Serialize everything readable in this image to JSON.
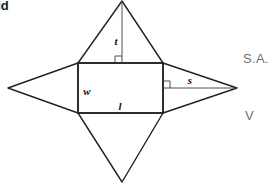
{
  "page": {
    "background_color": "#ffffff",
    "width": 276,
    "height": 184
  },
  "heading": {
    "text": "mid",
    "note_full_word": "pyramid",
    "clipped_left": true,
    "color": "#1b1b1b"
  },
  "formulas": {
    "surface_area_label": "S.A.",
    "volume_label": "V",
    "color": "#6f6f6f"
  },
  "diagram": {
    "stroke_color": "#222222",
    "fill_color": "none",
    "line_width": 1.4,
    "thin_line_width": 0.9,
    "labels": {
      "slant_height_top": "t",
      "width": "w",
      "length": "l",
      "slant_height_side": "s"
    },
    "geometry": {
      "rectangle": {
        "left": 78,
        "top": 63,
        "right": 163,
        "bottom": 113
      },
      "apex_top": {
        "x": 122,
        "y": 1
      },
      "apex_bottom": {
        "x": 122,
        "y": 182
      },
      "apex_left": {
        "x": 8,
        "y": 88
      },
      "apex_right": {
        "x": 237,
        "y": 88
      },
      "altitude_top": {
        "x1": 122,
        "y1": 1,
        "x2": 122,
        "y2": 63
      },
      "altitude_right": {
        "x1": 163,
        "y1": 88,
        "x2": 237,
        "y2": 88
      },
      "right_angle_marker_top": {
        "x": 116,
        "y": 57
      },
      "right_angle_marker_right": {
        "x": 163,
        "y": 82
      }
    },
    "label_positions": {
      "t": {
        "x": 116,
        "y": 41
      },
      "w": {
        "x": 86,
        "y": 93
      },
      "l": {
        "x": 119,
        "y": 111
      },
      "s": {
        "x": 188,
        "y": 86
      }
    }
  }
}
